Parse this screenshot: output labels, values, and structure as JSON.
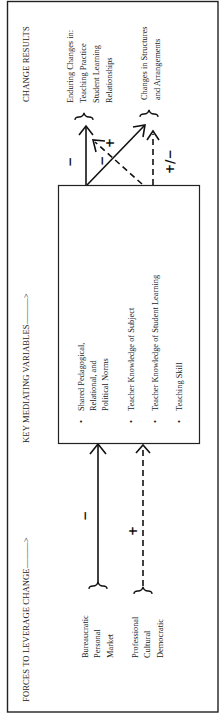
{
  "headers": {
    "change_results": "CHANGE RESULTS",
    "mediating": "KEY MEDIATING VARIABLES———>",
    "forces": "FORCES TO LEVERAGE CHANGE———>"
  },
  "forces": {
    "group_1": [
      "Bureaucratic",
      "Personal",
      "Market"
    ],
    "group_2": [
      "Professional",
      "Cultural",
      "Democratic"
    ]
  },
  "mediating_variables": {
    "items": [
      [
        "Shared Pedagogical,",
        "Relational, and",
        "Political Norms"
      ],
      [
        "Teacher Knowledge of Subject"
      ],
      [
        "Teacher Knowledge of Student Learning"
      ],
      [
        "Teaching Skill"
      ]
    ],
    "bullet": "•"
  },
  "results": {
    "enduring": [
      "Enduring Changes in:",
      "Teaching Practice",
      "Student Learning",
      "Relationships"
    ],
    "structures": [
      "Changes in Structures",
      "and Arrangements"
    ]
  },
  "signs": {
    "forces_group_1": "−",
    "forces_group_2": "+",
    "result_enduring_vertical": "−",
    "result_back_arrow_minus": "−",
    "result_back_arrow_plus": "+",
    "result_structures": "+/−"
  },
  "legend": {
    "solid_line": "solid arrow",
    "dashed_line": "dashed arrow"
  },
  "colors": {
    "ink": "#111111",
    "paper": "#ffffff"
  }
}
